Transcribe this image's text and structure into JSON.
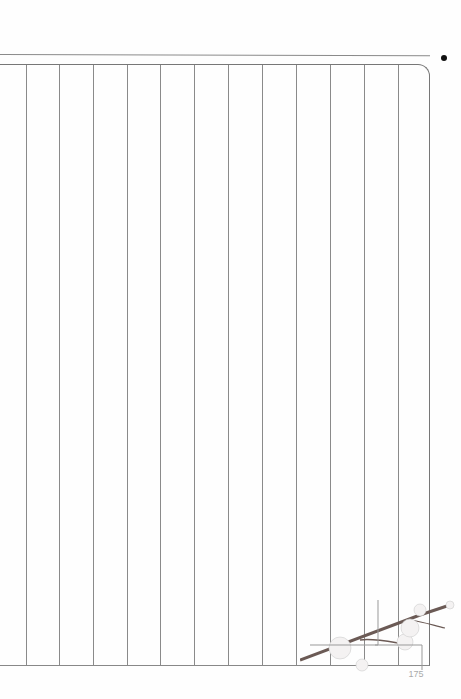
{
  "page": {
    "type": "vertical-lined writing paper",
    "page_number": "175",
    "column_count": 12,
    "line_color": "#8a8a8a",
    "bullet_icon": "dot-icon",
    "decoration": "plum-blossom-branch"
  },
  "vertical_lines_x": [
    26,
    59,
    93,
    127,
    160,
    194,
    228,
    262,
    296,
    330,
    364,
    398
  ]
}
